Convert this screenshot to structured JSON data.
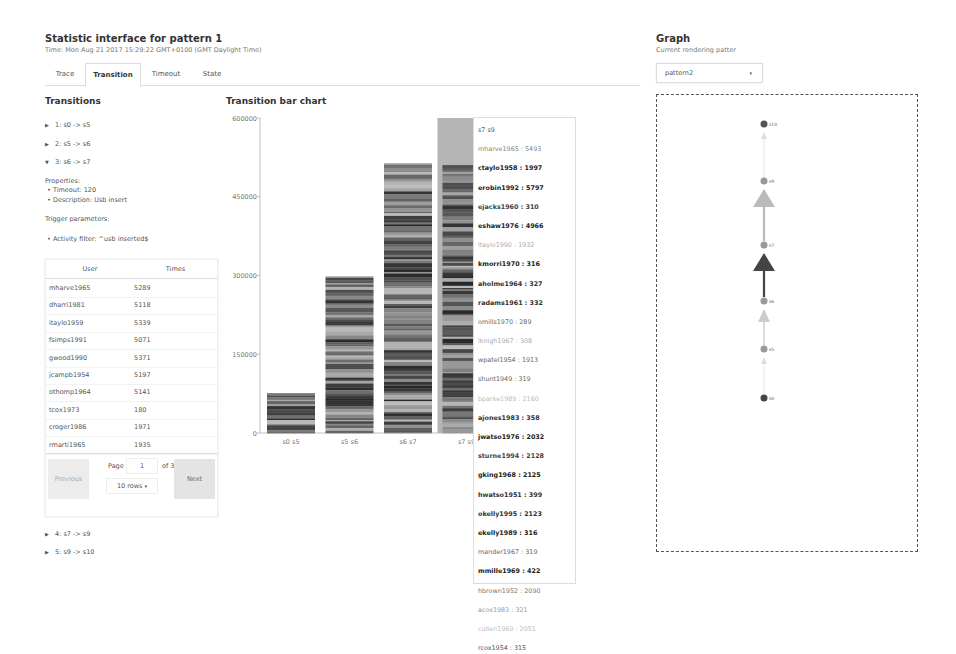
{
  "header": {
    "title": "Statistic interface for pattern 1",
    "time": "Time: Mon Aug 21 2017 15:29:22 GMT+0100 (GMT Daylight Time)"
  },
  "tabs": [
    {
      "label": "Trace",
      "active": false
    },
    {
      "label": "Transition",
      "active": true
    },
    {
      "label": "Timeout",
      "active": false
    },
    {
      "label": "State",
      "active": false
    }
  ],
  "transitions": {
    "title": "Transitions",
    "items": [
      {
        "label": "1: s0 -> s5",
        "expanded": false
      },
      {
        "label": "2: s5 -> s6",
        "expanded": false
      },
      {
        "label": "3: s6 -> s7",
        "expanded": true
      },
      {
        "label": "4: s7 -> s9",
        "expanded": false
      },
      {
        "label": "5: s9 -> s10",
        "expanded": false
      }
    ],
    "properties_label": "Properties:",
    "properties": [
      "Timeout: 120",
      "Description: Usb insert"
    ],
    "trigger_label": "Trigger parameters:",
    "triggers": [
      "Activity filter: ^usb inserted$"
    ]
  },
  "table": {
    "columns": [
      "User",
      "Times"
    ],
    "rows": [
      {
        "user": "mharve1965",
        "times": "5289"
      },
      {
        "user": "dharri1981",
        "times": "5118"
      },
      {
        "user": "itaylo1959",
        "times": "5339"
      },
      {
        "user": "fsimps1991",
        "times": "5071"
      },
      {
        "user": "gwood1990",
        "times": "5371"
      },
      {
        "user": "jcampb1954",
        "times": "5197"
      },
      {
        "user": "othomp1964",
        "times": "5141"
      },
      {
        "user": "tcox1973",
        "times": "180"
      },
      {
        "user": "croger1986",
        "times": "1971"
      },
      {
        "user": "rmarti1965",
        "times": "1935"
      }
    ],
    "pager": {
      "previous": "Previous",
      "next": "Next",
      "page_label": "Page",
      "page": "1",
      "of_label": "of 31",
      "rows_option": "10 rows",
      "caret": "▾"
    }
  },
  "chart_data": {
    "type": "bar",
    "title": "Transition bar chart",
    "categories": [
      "s0 s5",
      "s5 s6",
      "s6 s7",
      "s7 s9"
    ],
    "values": [
      76000,
      299000,
      514000,
      516000
    ],
    "stacked_by_user": true,
    "highlighted_category": "s7 s9",
    "xlabel": "",
    "ylabel": "",
    "ylim": [
      0,
      600000
    ],
    "yticks": [
      0,
      150000,
      300000,
      450000,
      600000
    ],
    "ytick_labels": [
      "0",
      "150000",
      "300000",
      "450000",
      "600000"
    ],
    "grid": false
  },
  "tooltip": {
    "header": "s7 s9",
    "entries": [
      {
        "text": "mharve1965 : 5493",
        "shade": "#888888"
      },
      {
        "text": "ctaylo1958 : 1997",
        "shade": "#222222"
      },
      {
        "text": "erobin1992 : 5797",
        "shade": "#222222"
      },
      {
        "text": "ejacks1960 : 310",
        "shade": "#444444"
      },
      {
        "text": "eshaw1976 : 4966",
        "shade": "#222222"
      },
      {
        "text": "ltaylo1990 : 1932",
        "shade": "#aaaaaa"
      },
      {
        "text": "kmorri1970 : 316",
        "shade": "#222222"
      },
      {
        "text": "aholme1964 : 327",
        "shade": "#333333"
      },
      {
        "text": "radams1961 : 332",
        "shade": "#333333"
      },
      {
        "text": "omills1970 : 289",
        "shade": "#666666"
      },
      {
        "text": "lknigh1967 : 308",
        "shade": "#aaaaaa"
      },
      {
        "text": "wpatel1954 : 1913",
        "shade": "#666666"
      },
      {
        "text": "shunt1949 : 319",
        "shade": "#666666"
      },
      {
        "text": "bparke1989 : 2160",
        "shade": "#bbbbbb"
      },
      {
        "text": "ajones1983 : 358",
        "shade": "#333333"
      },
      {
        "text": "jwatso1976 : 2032",
        "shade": "#222222"
      },
      {
        "text": "sturne1994 : 2128",
        "shade": "#444444"
      },
      {
        "text": "gking1968 : 2125",
        "shade": "#222222"
      },
      {
        "text": "hwatso1951 : 399",
        "shade": "#333333"
      },
      {
        "text": "okelly1995 : 2123",
        "shade": "#333333"
      },
      {
        "text": "ekelly1989 : 316",
        "shade": "#222222"
      },
      {
        "text": "mander1967 : 319",
        "shade": "#666666"
      },
      {
        "text": "mmille1969 : 422",
        "shade": "#222222"
      },
      {
        "text": "hbrown1952 : 2090",
        "shade": "#777777"
      },
      {
        "text": "acox1983 : 321",
        "shade": "#999999"
      },
      {
        "text": "cullen1969 : 2051",
        "shade": "#bbbbbb"
      },
      {
        "text": "rcox1954 : 315",
        "shade": "#555555"
      }
    ]
  },
  "graph": {
    "title": "Graph",
    "subtitle": "Current rendering patter",
    "selected_pattern": "pattern2",
    "caret": "▾",
    "nodes": [
      {
        "id": "s10",
        "color": "#555555"
      },
      {
        "id": "s9",
        "color": "#999999"
      },
      {
        "id": "s7",
        "color": "#999999"
      },
      {
        "id": "s6",
        "color": "#999999"
      },
      {
        "id": "s5",
        "color": "#999999"
      },
      {
        "id": "s0",
        "color": "#444444"
      }
    ],
    "edges": [
      {
        "from": "s0",
        "to": "s5",
        "color": "#dddddd",
        "weight": 1
      },
      {
        "from": "s5",
        "to": "s6",
        "color": "#cccccc",
        "weight": 2
      },
      {
        "from": "s6",
        "to": "s7",
        "color": "#444444",
        "weight": 3
      },
      {
        "from": "s7",
        "to": "s9",
        "color": "#bbbbbb",
        "weight": 3
      },
      {
        "from": "s9",
        "to": "s10",
        "color": "#dddddd",
        "weight": 1
      }
    ]
  }
}
